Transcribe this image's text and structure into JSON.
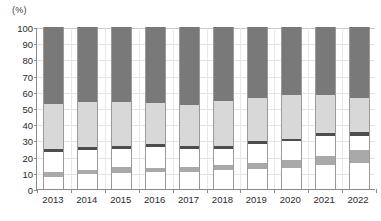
{
  "chart_data": {
    "type": "bar",
    "title": "",
    "subtitle": "",
    "xlabel": "",
    "ylabel": "(%)",
    "unit_label": "(%)",
    "stacked": true,
    "stack_total": 100,
    "grid": true,
    "legend_position": "none",
    "ylim": [
      0,
      100
    ],
    "ytick_step": 10,
    "ytick_labels": [
      "0",
      "10",
      "20",
      "30",
      "40",
      "50",
      "60",
      "70",
      "80",
      "90",
      "100"
    ],
    "ytick_values": [
      0,
      10,
      20,
      30,
      40,
      50,
      60,
      70,
      80,
      90,
      100
    ],
    "categories": [
      "2013",
      "2014",
      "2015",
      "2016",
      "2017",
      "2018",
      "2019",
      "2020",
      "2021",
      "2022"
    ],
    "series": [
      {
        "name": "segment-1-white-bottom",
        "color": "#ffffff",
        "values": [
          7.5,
          9.0,
          10.0,
          10.5,
          10.5,
          11.5,
          12.5,
          13.0,
          15.0,
          16.0
        ]
      },
      {
        "name": "segment-2-mid-gray",
        "color": "#a9a9a9",
        "values": [
          3.0,
          2.5,
          3.5,
          2.5,
          3.0,
          3.5,
          3.5,
          5.0,
          5.5,
          8.0
        ]
      },
      {
        "name": "segment-3-white-middle",
        "color": "#ffffff",
        "values": [
          12.5,
          12.5,
          11.5,
          13.0,
          11.5,
          10.0,
          12.0,
          11.5,
          12.5,
          9.0
        ]
      },
      {
        "name": "segment-4-dark-band",
        "color": "#4d4d4d",
        "values": [
          2.0,
          2.0,
          1.5,
          1.5,
          1.5,
          1.5,
          1.5,
          1.5,
          1.5,
          2.0
        ]
      },
      {
        "name": "segment-5-light-gray",
        "color": "#d8d8d8",
        "values": [
          27.5,
          28.0,
          27.0,
          25.5,
          25.5,
          28.0,
          26.5,
          27.0,
          23.5,
          21.0
        ]
      },
      {
        "name": "segment-6-dark-gray-top",
        "color": "#797979",
        "values": [
          47.5,
          46.0,
          46.5,
          47.0,
          48.0,
          45.5,
          44.0,
          42.0,
          42.0,
          44.0
        ]
      }
    ],
    "cumulative_tops": {
      "2013": [
        7.5,
        10.5,
        23.0,
        25.0,
        52.5,
        100
      ],
      "2014": [
        9.0,
        11.5,
        24.0,
        26.0,
        54.0,
        100
      ],
      "2015": [
        10.0,
        13.5,
        25.0,
        26.5,
        53.5,
        100
      ],
      "2016": [
        10.5,
        13.0,
        26.0,
        27.5,
        53.0,
        100
      ],
      "2017": [
        10.5,
        13.5,
        25.0,
        26.5,
        52.0,
        100
      ],
      "2018": [
        11.5,
        15.0,
        25.0,
        26.5,
        54.5,
        100
      ],
      "2019": [
        12.5,
        16.0,
        28.0,
        29.5,
        56.0,
        100
      ],
      "2020": [
        13.0,
        18.0,
        29.5,
        31.0,
        58.0,
        100
      ],
      "2021": [
        15.0,
        20.5,
        33.0,
        34.5,
        58.0,
        100
      ],
      "2022": [
        16.0,
        24.0,
        33.0,
        35.0,
        56.0,
        100
      ]
    }
  },
  "axis": {
    "y_unit": "(%)",
    "y_max_label": "100",
    "y_min_label": "0"
  }
}
